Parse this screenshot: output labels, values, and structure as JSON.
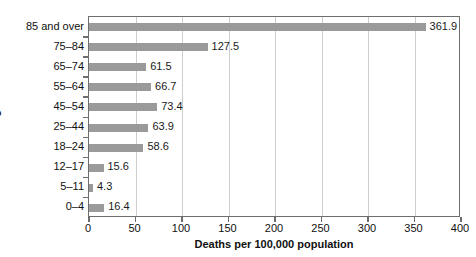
{
  "chart_data": {
    "type": "bar",
    "orientation": "horizontal",
    "title": "",
    "xlabel": "Deaths per 100,000 population",
    "ylabel": "Age",
    "categories": [
      "0–4",
      "5–11",
      "12–17",
      "18–24",
      "25–44",
      "45–54",
      "55–64",
      "65–74",
      "75–84",
      "85 and over"
    ],
    "values": [
      16.4,
      4.3,
      15.6,
      58.6,
      63.9,
      73.4,
      66.7,
      61.5,
      127.5,
      361.9
    ],
    "value_labels": [
      "16.4",
      "4.3",
      "15.6",
      "58.6",
      "63.9",
      "73.4",
      "66.7",
      "61.5",
      "127.5",
      "361.9"
    ],
    "xlim": [
      0,
      400
    ],
    "xticks": [
      0,
      50,
      100,
      150,
      200,
      250,
      300,
      350,
      400
    ],
    "xtick_labels": [
      "0",
      "50",
      "100",
      "150",
      "200",
      "250",
      "300",
      "350",
      "400"
    ],
    "grid": "vertical",
    "legend": "none",
    "bar_color": "#9a9a9a",
    "gridline_color": "#cdcdcd",
    "axis_color": "#6e6e6e",
    "background_color": "#ffffff"
  },
  "axis_titles": {
    "x": "Deaths per 100,000 population",
    "y": "Age"
  }
}
